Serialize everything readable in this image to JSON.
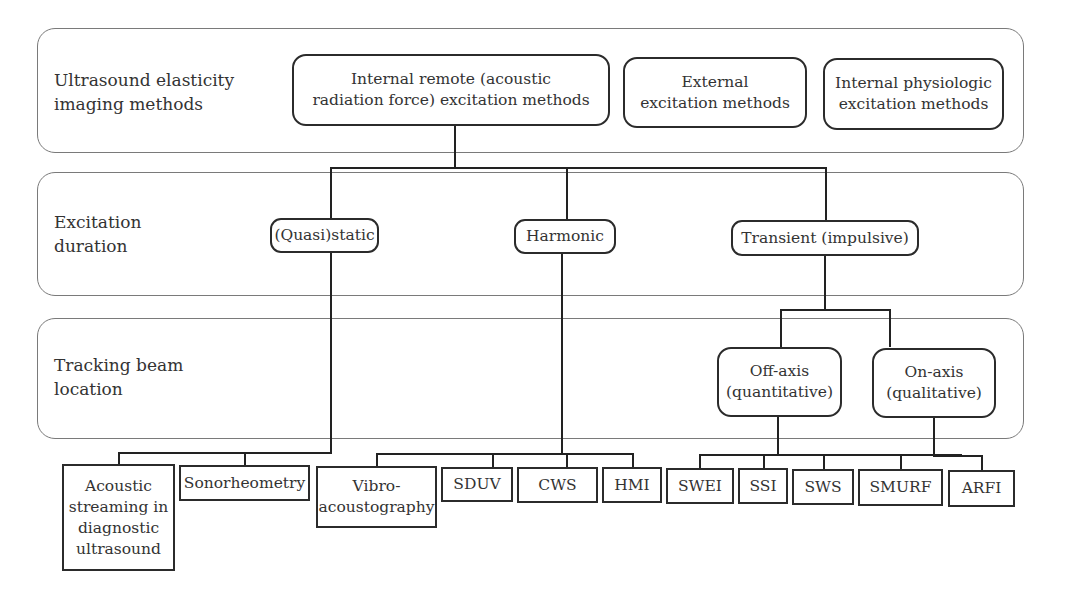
{
  "bands": [
    {
      "label": "Ultrasound elasticity\nimaging methods"
    },
    {
      "label": "Excitation\nduration"
    },
    {
      "label": "Tracking beam\nlocation"
    }
  ],
  "level1": [
    {
      "label": "Internal remote (acoustic\nradiation force) excitation methods"
    },
    {
      "label": "External\nexcitation methods"
    },
    {
      "label": "Internal physiologic\nexcitation methods"
    }
  ],
  "level2": [
    {
      "label": "(Quasi)static"
    },
    {
      "label": "Harmonic"
    },
    {
      "label": "Transient (impulsive)"
    }
  ],
  "level3": [
    {
      "label": "Off-axis\n(quantitative)"
    },
    {
      "label": "On-axis\n(qualitative)"
    }
  ],
  "leaves": [
    {
      "label": "Acoustic\nstreaming in\ndiagnostic\nultrasound"
    },
    {
      "label": "Sonorheometry"
    },
    {
      "label": "Vibro-\nacoustography"
    },
    {
      "label": "SDUV"
    },
    {
      "label": "CWS"
    },
    {
      "label": "HMI"
    },
    {
      "label": "SWEI"
    },
    {
      "label": "SSI"
    },
    {
      "label": "SWS"
    },
    {
      "label": "SMURF"
    },
    {
      "label": "ARFI"
    }
  ]
}
